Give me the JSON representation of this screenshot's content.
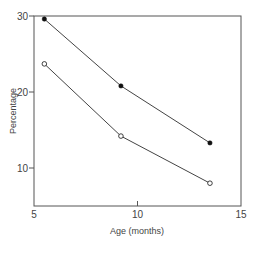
{
  "chart_data": {
    "type": "line",
    "title": "",
    "xlabel": "Age (months)",
    "ylabel": "Percentage",
    "xlim": [
      5,
      15
    ],
    "ylim": [
      5,
      30
    ],
    "x_ticks": [
      5,
      10,
      15
    ],
    "y_ticks": [
      10,
      20,
      30
    ],
    "grid": false,
    "legend": null,
    "series": [
      {
        "name": "filled circles",
        "marker": "filled-circle",
        "x": [
          5.5,
          9.2,
          13.5
        ],
        "values": [
          29.6,
          20.8,
          13.3
        ]
      },
      {
        "name": "open circles",
        "marker": "open-circle",
        "x": [
          5.5,
          9.2,
          13.5
        ],
        "values": [
          23.7,
          14.2,
          8.0
        ]
      }
    ]
  },
  "colors": {
    "axis": "#555555",
    "line": "#444444",
    "marker": "#111111",
    "background": "#ffffff"
  }
}
